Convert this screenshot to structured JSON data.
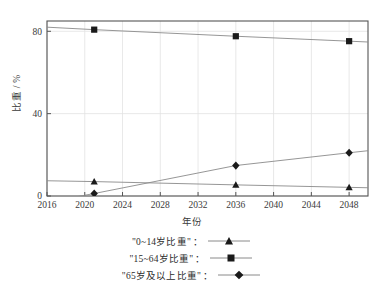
{
  "chart_data": {
    "type": "line",
    "title": "",
    "xlabel": "年份",
    "ylabel": "比重 / %",
    "xlim": [
      2016,
      2050
    ],
    "ylim": [
      0,
      85
    ],
    "xticks": [
      2016,
      2020,
      2024,
      2028,
      2032,
      2036,
      2040,
      2044,
      2048
    ],
    "yticks": [
      0,
      40,
      80
    ],
    "grid": true,
    "legend_position": "below",
    "marker_years": [
      2021,
      2036,
      2048
    ],
    "series": [
      {
        "name": "\"0~14岁比重\"",
        "marker": "triangle",
        "color": "#1a1a1a",
        "x": [
          2016,
          2021,
          2036,
          2048,
          2050
        ],
        "values": [
          7.4,
          7.0,
          5.4,
          4.2,
          4.0
        ],
        "marker_x": [
          2021,
          2036,
          2048
        ],
        "marker_values": [
          7.0,
          5.4,
          4.2
        ]
      },
      {
        "name": "\"15~64岁比重\"",
        "marker": "square",
        "color": "#1a1a1a",
        "x": [
          2016,
          2021,
          2036,
          2048,
          2050
        ],
        "values": [
          82.0,
          80.8,
          77.6,
          75.2,
          74.8
        ],
        "marker_x": [
          2021,
          2036,
          2048
        ],
        "marker_values": [
          80.8,
          77.6,
          75.2
        ]
      },
      {
        "name": "\"65岁及以上比重\"",
        "marker": "diamond",
        "color": "#1a1a1a",
        "x": [
          2016,
          2021,
          2036,
          2048,
          2050
        ],
        "values": [
          -3.0,
          1.2,
          14.8,
          21.0,
          22.0
        ],
        "marker_x": [
          2021,
          2036,
          2048
        ],
        "marker_values": [
          1.2,
          14.8,
          21.0
        ]
      }
    ]
  },
  "axes": {
    "y_title": "比重 / %",
    "x_title": "年份",
    "y_tick_labels": [
      "80",
      "40",
      "0"
    ],
    "x_tick_labels": [
      "2016",
      "2020",
      "2024",
      "2028",
      "2032",
      "2036",
      "2040",
      "2044",
      "2048"
    ]
  },
  "legend": {
    "separator": "：",
    "entries": [
      {
        "label": "\"0~14岁比重\"",
        "marker": "triangle"
      },
      {
        "label": "\"15~64岁比重\"",
        "marker": "square"
      },
      {
        "label": "\"65岁及以上比重\"",
        "marker": "diamond"
      }
    ]
  },
  "style": {
    "line_color": "#8a8a8a",
    "marker_color": "#1a1a1a",
    "axis_color": "#555555",
    "grid_color": "#e2e2e2",
    "text_color": "#2b2b2b"
  }
}
